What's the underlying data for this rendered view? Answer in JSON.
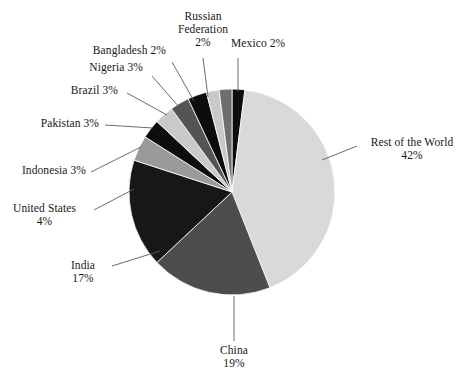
{
  "chart_data": {
    "type": "pie",
    "title": "",
    "subtitle": "",
    "xlabel": "",
    "ylabel": "",
    "grid": false,
    "legend_position": "none",
    "labels_as_callouts": true,
    "total_percent": 100,
    "start_angle_deg": 0,
    "direction": "clockwise",
    "categories": [
      "Mexico",
      "Rest of the World",
      "China",
      "India",
      "United States",
      "Indonesia",
      "Pakistan",
      "Brazil",
      "Nigeria",
      "Bangladesh",
      "Russian Federation"
    ],
    "values": [
      2,
      42,
      19,
      17,
      4,
      3,
      3,
      3,
      3,
      2,
      2
    ],
    "value_suffix": "%",
    "colors": [
      "#0d0d0d",
      "#d9d9d9",
      "#4d4d4d",
      "#171717",
      "#9a9a9a",
      "#0d0d0d",
      "#c9c9c9",
      "#545454",
      "#0d0d0d",
      "#c9c9c9",
      "#6e6e6e"
    ],
    "slices": [
      {
        "name": "Mexico",
        "value": 2,
        "color": "#0d0d0d"
      },
      {
        "name": "Rest of the World",
        "value": 42,
        "color": "#d9d9d9"
      },
      {
        "name": "China",
        "value": 19,
        "color": "#4d4d4d"
      },
      {
        "name": "India",
        "value": 17,
        "color": "#171717"
      },
      {
        "name": "United States",
        "value": 4,
        "color": "#9a9a9a"
      },
      {
        "name": "Indonesia",
        "value": 3,
        "color": "#0d0d0d"
      },
      {
        "name": "Pakistan",
        "value": 3,
        "color": "#c9c9c9"
      },
      {
        "name": "Brazil",
        "value": 3,
        "color": "#545454"
      },
      {
        "name": "Nigeria",
        "value": 3,
        "color": "#0d0d0d"
      },
      {
        "name": "Bangladesh",
        "value": 2,
        "color": "#c9c9c9"
      },
      {
        "name": "Russian Federation",
        "value": 2,
        "color": "#6e6e6e"
      }
    ]
  },
  "callouts": {
    "russian_federation": {
      "line1": "Russian",
      "line2": "Federation",
      "line3": "2%"
    },
    "mexico": {
      "line1": "Mexico 2%"
    },
    "bangladesh": {
      "line1": "Bangladesh 2%"
    },
    "nigeria": {
      "line1": "Nigeria 3%"
    },
    "brazil": {
      "line1": "Brazil 3%"
    },
    "pakistan": {
      "line1": "Pakistan 3%"
    },
    "indonesia": {
      "line1": "Indonesia 3%"
    },
    "united_states": {
      "line1": "United States",
      "line2": "4%"
    },
    "india": {
      "line1": "India",
      "line2": "17%"
    },
    "china": {
      "line1": "China",
      "line2": "19%"
    },
    "rest_of_the_world": {
      "line1": "Rest of the World",
      "line2": "42%"
    }
  },
  "style": {
    "background": "#ffffff",
    "text_color": "#171717",
    "leader_line_color": "#5a5a5a",
    "slice_border_color": "#ffffff"
  }
}
